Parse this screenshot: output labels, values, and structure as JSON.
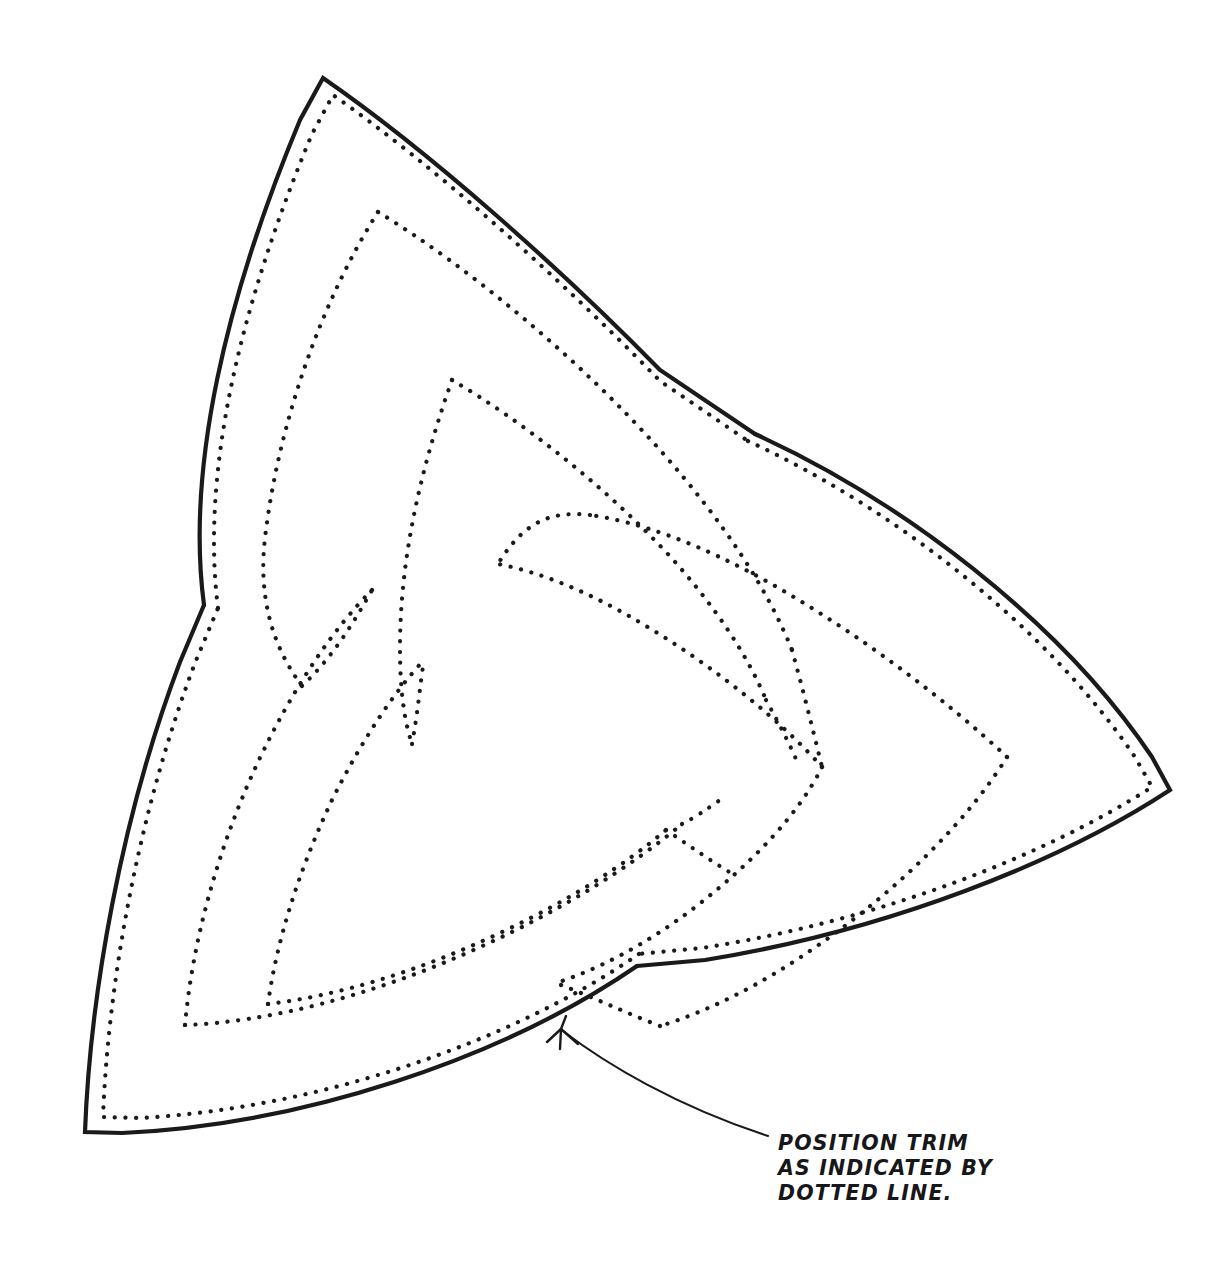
{
  "document": {
    "type": "technical-pattern-drawing",
    "title": "Triquetra trim pattern piece",
    "background_color": "#ffffff",
    "ink_color": "#1a1a1a"
  },
  "annotation": {
    "name": "position-trim-note",
    "lines": [
      "POSITION TRIM",
      "AS INDICATED BY",
      "DOTTED LINE."
    ],
    "line1": "POSITION TRIM",
    "line2": "AS INDICATED BY",
    "line3": "DOTTED LINE.",
    "text_origin": {
      "x": 778,
      "y": 1150
    },
    "line_height": 25,
    "leader": {
      "name": "leader-line",
      "path": "M 563 1031 C 606 1064 676 1106 768 1136",
      "arrow_tip": {
        "x": 561,
        "y": 1029
      },
      "arrow_barbs": [
        "M 561 1029 L 577 1043",
        "M 561 1029 L 560 1048",
        "M 561 1029 L 548 1041"
      ]
    }
  },
  "geometry": {
    "outer_solid": {
      "name": "cut-outline",
      "description": "Solid triquetra cut line with three lobe tips and three cusps",
      "tips": [
        {
          "x": 323,
          "y": 78
        },
        {
          "x": 1170,
          "y": 790
        },
        {
          "x": 85,
          "y": 1132
        }
      ],
      "cusps": [
        {
          "x": 755,
          "y": 434
        },
        {
          "x": 637,
          "y": 966
        },
        {
          "x": 204,
          "y": 605
        }
      ],
      "path": "M 323 78 C 470 110 650 240 740 380 L 755 434 L 792 452 C 930 520 1090 660 1162 778 L 1170 790 L 1165 806 C 1118 930 990 1060 860 1130 L 806 1158 M 323 78 C 245 140 175 265 150 400 C 130 500 160 560 196 598 L 204 605 L 196 624 C 140 740 90 900 80 1075 L 85 1132 L 103 1137 C 240 1155 430 1110 560 1030 L 637 966 L 655 958 C 700 940 745 934 790 940 L 806 1158"
    },
    "outer_dotted": {
      "name": "trim-line-outer",
      "description": "Dotted trim line running parallel just inside the solid cut line",
      "offset_px": 14
    },
    "inner_dotted_knot": {
      "name": "trim-line-inner-knot",
      "description": "Interlaced dotted triquetra band inside the piece",
      "tips": [
        {
          "x": 378,
          "y": 212
        },
        {
          "x": 1007,
          "y": 757
        },
        {
          "x": 185,
          "y": 1025
        }
      ]
    }
  }
}
